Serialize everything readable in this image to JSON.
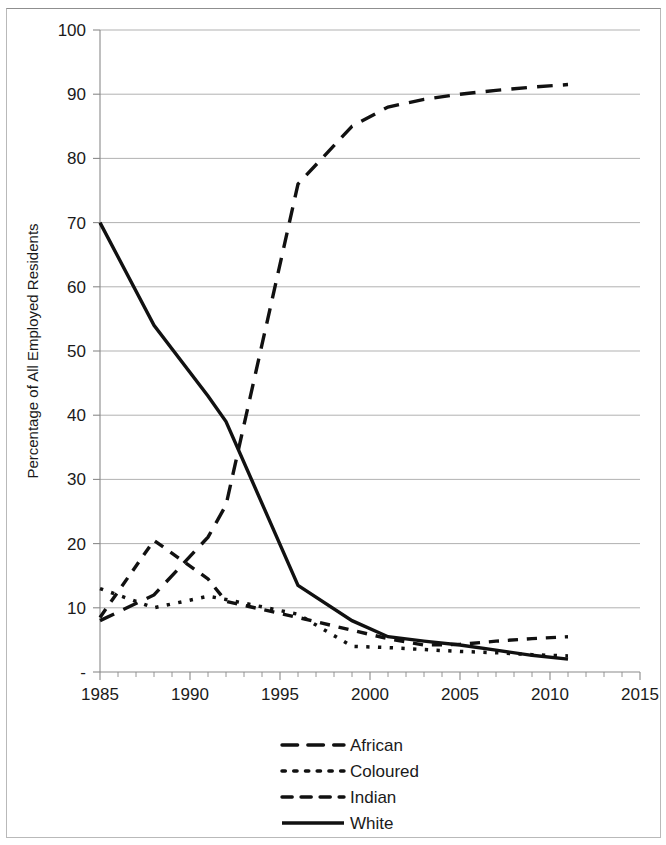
{
  "chart_data": {
    "type": "line",
    "title": "",
    "xlabel": "",
    "ylabel": "Percentage of All Employed Residents",
    "xlim": [
      1985,
      2015
    ],
    "ylim": [
      0,
      100
    ],
    "grid": true,
    "legend_position": "bottom",
    "x_ticks": [
      "1985",
      "1990",
      "1995",
      "2000",
      "2005",
      "2010",
      "2015"
    ],
    "x_tick_values": [
      1985,
      1990,
      1995,
      2000,
      2005,
      2010,
      2015
    ],
    "x_minor_tick_step": 1,
    "y_ticks": [
      "-",
      "10",
      "20",
      "30",
      "40",
      "50",
      "60",
      "70",
      "80",
      "90",
      "100"
    ],
    "y_tick_values": [
      0,
      10,
      20,
      30,
      40,
      50,
      60,
      70,
      80,
      90,
      100
    ],
    "series": [
      {
        "name": "African",
        "style": "long-dash",
        "color": "#111111",
        "x": [
          1985,
          1988,
          1991,
          1992,
          1996,
          1999,
          2001,
          2003,
          2005,
          2007,
          2009,
          2011
        ],
        "values": [
          8.0,
          12.0,
          21.0,
          26.0,
          76.0,
          85.0,
          88.0,
          89.2,
          90.0,
          90.6,
          91.1,
          91.5
        ]
      },
      {
        "name": "Coloured",
        "style": "dotted",
        "color": "#111111",
        "x": [
          1985,
          1988,
          1991,
          1992,
          1996,
          1999,
          2001,
          2003,
          2005,
          2007,
          2009,
          2011
        ],
        "values": [
          13.0,
          10.0,
          11.8,
          11.3,
          9.0,
          4.0,
          3.8,
          3.5,
          3.2,
          3.0,
          2.7,
          2.5
        ]
      },
      {
        "name": "Indian",
        "style": "dash",
        "color": "#111111",
        "x": [
          1985,
          1988,
          1991,
          1992,
          1996,
          1999,
          2001,
          2003,
          2005,
          2007,
          2009,
          2011
        ],
        "values": [
          8.5,
          20.5,
          14.5,
          11.0,
          8.5,
          6.5,
          5.2,
          4.2,
          4.3,
          4.8,
          5.2,
          5.5
        ]
      },
      {
        "name": "White",
        "style": "solid",
        "color": "#111111",
        "x": [
          1985,
          1988,
          1991,
          1992,
          1996,
          1999,
          2001,
          2003,
          2005,
          2007,
          2009,
          2011
        ],
        "values": [
          70.0,
          54.0,
          43.0,
          39.0,
          13.5,
          8.0,
          5.5,
          4.8,
          4.2,
          3.4,
          2.6,
          2.0
        ]
      }
    ]
  },
  "legend": {
    "items": [
      {
        "label": "African",
        "style": "long-dash"
      },
      {
        "label": "Coloured",
        "style": "dotted"
      },
      {
        "label": "Indian",
        "style": "dash"
      },
      {
        "label": "White",
        "style": "solid"
      }
    ]
  }
}
